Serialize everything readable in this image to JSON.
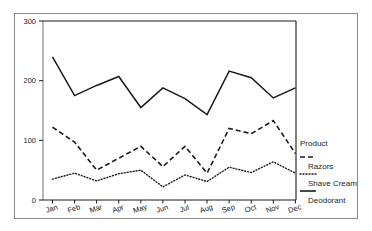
{
  "chart_data": {
    "type": "line",
    "title": "",
    "subtitle": "",
    "xlabel": "",
    "ylabel": "",
    "categories": [
      "Jan",
      "Feb",
      "Mar",
      "Apr",
      "May",
      "Jun",
      "Jul",
      "Aug",
      "Sep",
      "Oct",
      "Nov",
      "Dec"
    ],
    "series": [
      {
        "name": "Razors",
        "style": "dashed",
        "color": "#1b1b1b",
        "values": [
          122,
          97,
          50,
          70,
          90,
          56,
          90,
          45,
          120,
          111,
          133,
          78
        ]
      },
      {
        "name": "Shave Cream",
        "style": "dotted",
        "color": "#1b1b1b",
        "values": [
          35,
          45,
          32,
          44,
          50,
          22,
          42,
          31,
          55,
          46,
          64,
          45
        ]
      },
      {
        "name": "Deodorant",
        "style": "solid",
        "color": "#1b1b1b",
        "values": [
          240,
          175,
          192,
          207,
          155,
          188,
          170,
          143,
          216,
          205,
          171,
          188
        ]
      }
    ],
    "ylim": [
      0,
      300
    ],
    "yticks": [
      0,
      100,
      200,
      300
    ],
    "ytick_labels": [
      "0",
      "100",
      "200",
      "300"
    ],
    "grid": false,
    "legend_position": "right",
    "legend_title": "Product"
  },
  "legend": {
    "title": "Product",
    "entries": [
      {
        "label": "Razors",
        "style": "dashed"
      },
      {
        "label": "Shave Cream",
        "style": "dotted"
      },
      {
        "label": "Deodorant",
        "style": "solid"
      }
    ]
  },
  "axes": {
    "y_tick_labels": [
      "300",
      "200",
      "100",
      "0"
    ],
    "x_tick_labels": [
      "Jan",
      "Feb",
      "Mar",
      "Apr",
      "May",
      "Jun",
      "Jul",
      "Aug",
      "Sep",
      "Oct",
      "Nov",
      "Dec"
    ]
  }
}
